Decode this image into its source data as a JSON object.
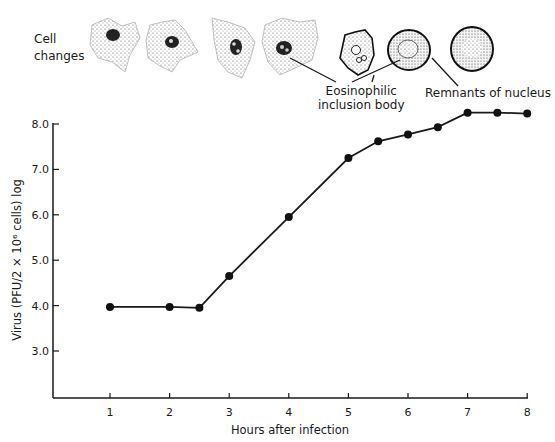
{
  "figure": {
    "cell_changes_label_line1": "Cell",
    "cell_changes_label_line2": "changes",
    "callouts": {
      "inclusion_line1": "Eosinophilic",
      "inclusion_line2": "inclusion body",
      "nucleus": "Remnants of nucleus"
    }
  },
  "chart_data": {
    "type": "line",
    "title": "",
    "xlabel": "Hours after infection",
    "ylabel": "Virus (PFU/2 × 10⁶ cells) log",
    "x_ticks": [
      "1",
      "2",
      "3",
      "4",
      "5",
      "6",
      "7",
      "8"
    ],
    "y_ticks": [
      "3.0",
      "4.0",
      "5.0",
      "6.0",
      "7.0",
      "8.0"
    ],
    "xlim": [
      0,
      8
    ],
    "ylim": [
      2.0,
      8.0
    ],
    "grid": false,
    "legend": null,
    "series": [
      {
        "name": "Virus titer",
        "x": [
          1,
          2,
          2.5,
          3,
          4,
          5,
          5.5,
          6,
          6.5,
          7,
          7.5,
          8
        ],
        "values": [
          3.97,
          3.97,
          3.95,
          4.65,
          5.95,
          7.25,
          7.62,
          7.77,
          7.93,
          8.25,
          8.25,
          8.23
        ]
      }
    ],
    "annotations": [
      "Cell changes",
      "Eosinophilic inclusion body",
      "Remnants of nucleus"
    ]
  }
}
